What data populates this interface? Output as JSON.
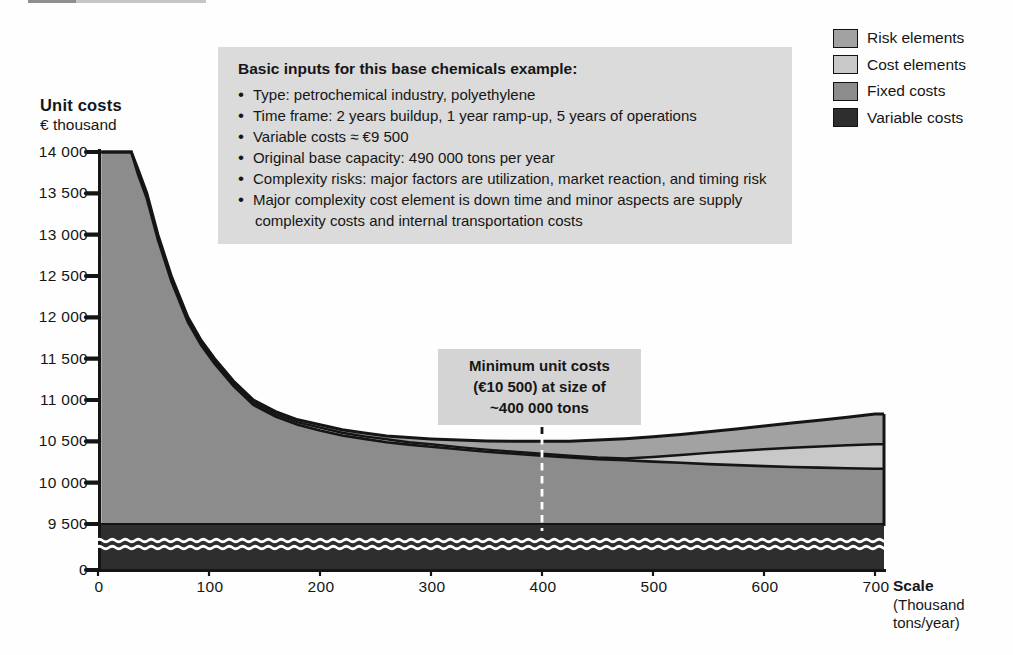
{
  "y_axis": {
    "title_line1": "Unit costs",
    "title_line2": "€ thousand",
    "ticks": [
      {
        "label": "14 000",
        "value": 14000
      },
      {
        "label": "13 500",
        "value": 13500
      },
      {
        "label": "13 000",
        "value": 13000
      },
      {
        "label": "12 500",
        "value": 12500
      },
      {
        "label": "12 000",
        "value": 12000
      },
      {
        "label": "11 500",
        "value": 11500
      },
      {
        "label": "11 000",
        "value": 11000
      },
      {
        "label": "10 500",
        "value": 10500
      },
      {
        "label": "10 000",
        "value": 10000
      },
      {
        "label": "9 500",
        "value": 9500
      },
      {
        "label": "0",
        "value": 0
      }
    ]
  },
  "x_axis": {
    "title_line1": "Scale",
    "title_line2": "(Thousand",
    "title_line3": "tons/year)",
    "ticks": [
      {
        "label": "0",
        "value": 0
      },
      {
        "label": "100",
        "value": 100
      },
      {
        "label": "200",
        "value": 200
      },
      {
        "label": "300",
        "value": 300
      },
      {
        "label": "400",
        "value": 400
      },
      {
        "label": "500",
        "value": 500
      },
      {
        "label": "600",
        "value": 600
      },
      {
        "label": "700",
        "value": 700
      }
    ]
  },
  "legend": [
    {
      "label": "Risk elements",
      "color": "#a2a2a2"
    },
    {
      "label": "Cost elements",
      "color": "#c8c8c8"
    },
    {
      "label": "Fixed costs",
      "color": "#8c8c8c"
    },
    {
      "label": "Variable costs",
      "color": "#2e2e2e"
    }
  ],
  "info_box": {
    "title": "Basic inputs for this base chemicals example:",
    "bullets": [
      "Type: petrochemical industry, polyethylene",
      "Time frame: 2 years buildup, 1 year ramp-up, 5 years of operations",
      "Variable costs ≈ €9 500",
      "Original base capacity: 490 000 tons per year",
      "Complexity risks: major factors are utilization, market reaction, and timing risk",
      "Major complexity cost element is down time and minor aspects are supply complexity costs and internal transportation costs"
    ]
  },
  "annotation": {
    "line1": "Minimum unit costs",
    "line2": "(€10 500) at size of",
    "line3": "~400 000 tons",
    "x_value": 400
  },
  "chart_data": {
    "type": "area",
    "stacked": true,
    "xlabel": "Scale (Thousand tons/year)",
    "ylabel": "Unit costs (€ thousand)",
    "xlim": [
      0,
      700
    ],
    "ylim_upper_segment": [
      9500,
      14000
    ],
    "axis_break_between": [
      0,
      9500
    ],
    "grid": false,
    "legend_position": "top-right",
    "annotation_min": {
      "x": 400,
      "y": 10500
    },
    "series": [
      {
        "name": "Variable costs",
        "kind": "band",
        "top_value": 9500,
        "bottom_value": 0,
        "color": "#2e2e2e",
        "note": "flat band with axis break"
      },
      {
        "name": "Fixed costs",
        "kind": "area-top-boundary",
        "base_value": 9500,
        "color": "#8c8c8c",
        "points": [
          [
            3,
            14000
          ],
          [
            30,
            14000
          ],
          [
            36,
            13730
          ],
          [
            44,
            13440
          ],
          [
            54,
            12940
          ],
          [
            66,
            12440
          ],
          [
            81,
            11940
          ],
          [
            93,
            11660
          ],
          [
            105,
            11440
          ],
          [
            122,
            11170
          ],
          [
            140,
            10940
          ],
          [
            160,
            10800
          ],
          [
            180,
            10700
          ],
          [
            200,
            10630
          ],
          [
            220,
            10570
          ],
          [
            240,
            10530
          ],
          [
            260,
            10490
          ],
          [
            280,
            10460
          ],
          [
            300,
            10435
          ],
          [
            325,
            10405
          ],
          [
            350,
            10375
          ],
          [
            375,
            10350
          ],
          [
            400,
            10325
          ],
          [
            425,
            10305
          ],
          [
            450,
            10285
          ],
          [
            475,
            10270
          ],
          [
            500,
            10255
          ],
          [
            525,
            10240
          ],
          [
            550,
            10225
          ],
          [
            575,
            10212
          ],
          [
            600,
            10200
          ],
          [
            625,
            10190
          ],
          [
            650,
            10182
          ],
          [
            675,
            10175
          ],
          [
            700,
            10168
          ]
        ]
      },
      {
        "name": "Cost elements",
        "kind": "area-top-boundary",
        "color": "#c8c8c8",
        "points": [
          [
            3,
            14000
          ],
          [
            30,
            14000
          ],
          [
            36,
            13760
          ],
          [
            44,
            13470
          ],
          [
            54,
            12970
          ],
          [
            66,
            12470
          ],
          [
            81,
            11970
          ],
          [
            93,
            11690
          ],
          [
            105,
            11470
          ],
          [
            122,
            11200
          ],
          [
            140,
            10970
          ],
          [
            160,
            10830
          ],
          [
            180,
            10730
          ],
          [
            200,
            10665
          ],
          [
            220,
            10605
          ],
          [
            240,
            10560
          ],
          [
            260,
            10525
          ],
          [
            280,
            10490
          ],
          [
            300,
            10465
          ],
          [
            325,
            10430
          ],
          [
            350,
            10400
          ],
          [
            375,
            10375
          ],
          [
            400,
            10350
          ],
          [
            425,
            10325
          ],
          [
            450,
            10305
          ],
          [
            475,
            10292
          ],
          [
            500,
            10310
          ],
          [
            525,
            10335
          ],
          [
            550,
            10360
          ],
          [
            575,
            10383
          ],
          [
            600,
            10405
          ],
          [
            625,
            10422
          ],
          [
            650,
            10438
          ],
          [
            675,
            10452
          ],
          [
            700,
            10465
          ]
        ]
      },
      {
        "name": "Risk elements",
        "kind": "area-top-boundary",
        "color": "#a2a2a2",
        "points": [
          [
            3,
            14000
          ],
          [
            30,
            14000
          ],
          [
            36,
            13790
          ],
          [
            44,
            13500
          ],
          [
            54,
            13000
          ],
          [
            66,
            12500
          ],
          [
            81,
            12000
          ],
          [
            93,
            11720
          ],
          [
            105,
            11500
          ],
          [
            122,
            11230
          ],
          [
            140,
            11000
          ],
          [
            160,
            10860
          ],
          [
            180,
            10760
          ],
          [
            200,
            10700
          ],
          [
            220,
            10640
          ],
          [
            240,
            10600
          ],
          [
            260,
            10565
          ],
          [
            280,
            10545
          ],
          [
            300,
            10530
          ],
          [
            325,
            10515
          ],
          [
            350,
            10505
          ],
          [
            375,
            10500
          ],
          [
            400,
            10500
          ],
          [
            425,
            10502
          ],
          [
            450,
            10515
          ],
          [
            475,
            10532
          ],
          [
            500,
            10555
          ],
          [
            525,
            10582
          ],
          [
            550,
            10615
          ],
          [
            575,
            10648
          ],
          [
            600,
            10685
          ],
          [
            625,
            10720
          ],
          [
            650,
            10755
          ],
          [
            675,
            10792
          ],
          [
            700,
            10830
          ]
        ]
      }
    ]
  }
}
